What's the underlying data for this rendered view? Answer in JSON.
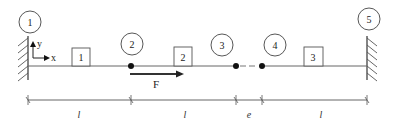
{
  "diagram": {
    "type": "mechanical-beam-schematic",
    "nodes": [
      {
        "id": "node-1",
        "label": "1",
        "kind": "fixed-support-left"
      },
      {
        "id": "node-2",
        "label": "2",
        "kind": "pin"
      },
      {
        "id": "node-3",
        "label": "3",
        "kind": "pin"
      },
      {
        "id": "node-4",
        "label": "4",
        "kind": "pin"
      },
      {
        "id": "node-5",
        "label": "5",
        "kind": "fixed-support-right"
      }
    ],
    "elements": [
      {
        "id": "element-1",
        "label": "1"
      },
      {
        "id": "element-2",
        "label": "2"
      },
      {
        "id": "element-3",
        "label": "3"
      }
    ],
    "axes": {
      "x_label": "x",
      "y_label": "y"
    },
    "force": {
      "label": "F",
      "direction": "right"
    },
    "gap": {
      "style": "dashed",
      "between": [
        "3",
        "4"
      ]
    },
    "dimensions": [
      {
        "label": "l"
      },
      {
        "label": "l"
      },
      {
        "label": "e"
      },
      {
        "label": "l"
      }
    ]
  }
}
